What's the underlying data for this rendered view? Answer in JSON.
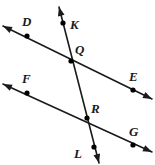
{
  "figure": {
    "background_color": "#ffffff",
    "stroke_color": "#1a1a1a",
    "point_color": "#000000",
    "width": 155,
    "height": 165
  },
  "labels": {
    "D": "D",
    "E": "E",
    "F": "F",
    "G": "G",
    "K": "K",
    "L": "L",
    "Q": "Q",
    "R": "R"
  },
  "chart_data": {
    "type": "diagram",
    "lines": [
      {
        "name": "line-DE",
        "from": [
          3,
          26
        ],
        "to": [
          152,
          99
        ],
        "arrows": "both",
        "points": [
          "D",
          "Q",
          "E"
        ]
      },
      {
        "name": "line-FG",
        "from": [
          3,
          84
        ],
        "to": [
          152,
          152
        ],
        "arrows": "both",
        "points": [
          "F",
          "R",
          "G"
        ]
      },
      {
        "name": "line-KL",
        "from": [
          59,
          7
        ],
        "to": [
          99,
          163
        ],
        "arrows": "both",
        "points": [
          "K",
          "Q",
          "R",
          "L"
        ]
      }
    ],
    "points": [
      {
        "name": "D",
        "x": 27,
        "y": 36,
        "label_x": 22,
        "label_y": 26
      },
      {
        "name": "E",
        "x": 133,
        "y": 90,
        "label_x": 129,
        "label_y": 81
      },
      {
        "name": "F",
        "x": 27,
        "y": 93,
        "label_x": 22,
        "label_y": 83
      },
      {
        "name": "G",
        "x": 133,
        "y": 145,
        "label_x": 129,
        "label_y": 136
      },
      {
        "name": "K",
        "x": 63,
        "y": 23,
        "label_x": 70,
        "label_y": 29
      },
      {
        "name": "L",
        "x": 94,
        "y": 147,
        "label_x": 74,
        "label_y": 158
      },
      {
        "name": "Q",
        "x": 71,
        "y": 61,
        "label_x": 75,
        "label_y": 54
      },
      {
        "name": "R",
        "x": 87,
        "y": 118,
        "label_x": 91,
        "label_y": 113
      }
    ]
  }
}
